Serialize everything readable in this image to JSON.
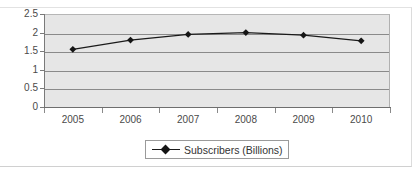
{
  "chart_data": {
    "type": "line",
    "title": "",
    "xlabel": "",
    "ylabel": "",
    "categories": [
      "2005",
      "2006",
      "2007",
      "2008",
      "2009",
      "2010"
    ],
    "series": [
      {
        "name": "Subscribers (Billions)",
        "values": [
          1.55,
          1.8,
          1.95,
          2.0,
          1.93,
          1.78
        ],
        "marker": "diamond",
        "line_color": "#1a1a1a",
        "marker_color": "#151515"
      }
    ],
    "ylim": [
      0,
      2.5
    ],
    "ytick_labels": [
      "2.5",
      "2",
      "1.5",
      "1",
      "0.5",
      "0"
    ],
    "ytick_values": [
      2.5,
      2,
      1.5,
      1,
      0.5,
      0
    ],
    "grid": true,
    "grid_color": "#8a8a8a",
    "plot_background": "#e6e6e6",
    "legend_position": "bottom"
  },
  "legend": {
    "entries": [
      {
        "label": "Subscribers (Billions)",
        "marker_name": "diamond-marker"
      }
    ]
  }
}
